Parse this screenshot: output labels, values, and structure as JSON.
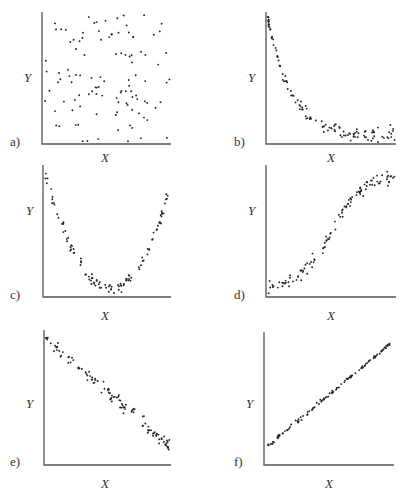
{
  "figure": {
    "panels": [
      {
        "id": "a",
        "tag": "a)",
        "xlabel": "X",
        "ylabel": "Y",
        "pattern": "no correlation (random scatter)"
      },
      {
        "id": "b",
        "tag": "b)",
        "xlabel": "X",
        "ylabel": "Y",
        "pattern": "negative nonlinear (exponential decay)"
      },
      {
        "id": "c",
        "tag": "c)",
        "xlabel": "X",
        "ylabel": "Y",
        "pattern": "U-shaped (quadratic)"
      },
      {
        "id": "d",
        "tag": "d)",
        "xlabel": "X",
        "ylabel": "Y",
        "pattern": "positive nonlinear (sigmoid-like)"
      },
      {
        "id": "e",
        "tag": "e)",
        "xlabel": "X",
        "ylabel": "Y",
        "pattern": "negative linear"
      },
      {
        "id": "f",
        "tag": "f)",
        "xlabel": "X",
        "ylabel": "Y",
        "pattern": "strong positive linear"
      }
    ]
  },
  "chart_data": [
    {
      "type": "scatter",
      "title": "a)",
      "xlabel": "X",
      "ylabel": "Y",
      "grid": false,
      "ticks": "none",
      "description": "Random scatter, no relationship between X and Y",
      "trend": {
        "shape": "none"
      }
    },
    {
      "type": "scatter",
      "title": "b)",
      "xlabel": "X",
      "ylabel": "Y",
      "grid": false,
      "ticks": "none",
      "description": "Y decreases steeply at low X then levels off (exponential decay)",
      "trend": {
        "shape": "decay"
      }
    },
    {
      "type": "scatter",
      "title": "c)",
      "xlabel": "X",
      "ylabel": "Y",
      "grid": false,
      "ticks": "none",
      "description": "Y high at both ends of X, minimum near the middle (U-shape)",
      "trend": {
        "shape": "u"
      }
    },
    {
      "type": "scatter",
      "title": "d)",
      "xlabel": "X",
      "ylabel": "Y",
      "grid": false,
      "ticks": "none",
      "description": "Y low and flat for small X, rises steeply, then flattens at high X (S-curve)",
      "trend": {
        "shape": "sigmoid"
      }
    },
    {
      "type": "scatter",
      "title": "e)",
      "xlabel": "X",
      "ylabel": "Y",
      "grid": false,
      "ticks": "none",
      "description": "Moderate negative linear relationship",
      "trend": {
        "shape": "linear",
        "slope": "negative"
      }
    },
    {
      "type": "scatter",
      "title": "f)",
      "xlabel": "X",
      "ylabel": "Y",
      "grid": false,
      "ticks": "none",
      "description": "Strong positive linear relationship with little scatter",
      "trend": {
        "shape": "linear",
        "slope": "positive"
      }
    }
  ]
}
